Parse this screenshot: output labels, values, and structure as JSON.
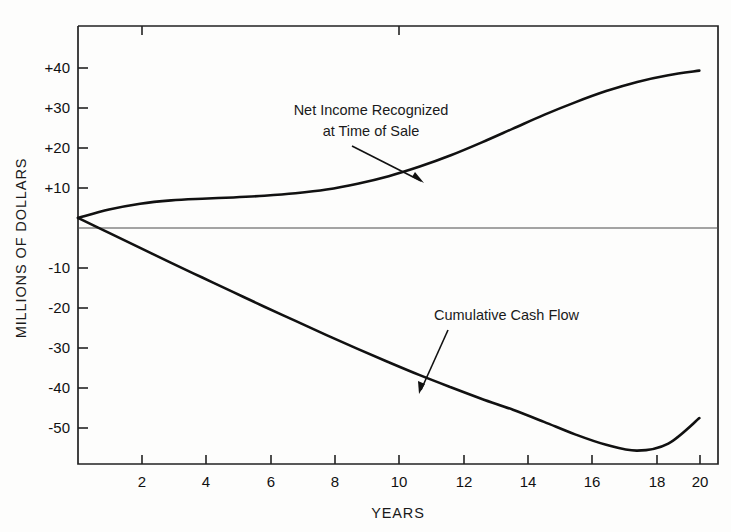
{
  "chart_data": {
    "type": "line",
    "title": "",
    "subtitle": "",
    "xlabel": "YEARS",
    "ylabel": "MILLIONS OF DOLLARS",
    "xlim": [
      0,
      20.6
    ],
    "ylim": [
      -59,
      46
    ],
    "grid": false,
    "legend_position": "inline-annotations",
    "x_ticks": [
      "2",
      "4",
      "6",
      "8",
      "10",
      "12",
      "14",
      "16",
      "18",
      "20"
    ],
    "x_tick_values": [
      2,
      4,
      6,
      8,
      10,
      12,
      14,
      16,
      18,
      20
    ],
    "y_ticks": [
      "+40",
      "+30",
      "+20",
      "+10",
      "-10",
      "-20",
      "-30",
      "-40",
      "-50"
    ],
    "y_tick_values": [
      40,
      30,
      20,
      10,
      -10,
      -20,
      -30,
      -40,
      -50
    ],
    "zero_line": 0,
    "x": [
      0,
      1,
      2,
      3,
      4,
      5,
      6,
      7,
      8,
      9,
      10,
      11,
      12,
      13,
      14,
      15,
      16,
      17,
      18,
      19,
      20
    ],
    "series": [
      {
        "name": "Net Income Recognized at Time of Sale",
        "values": [
          0,
          2.0,
          3.4,
          4.2,
          4.6,
          4.9,
          5.3,
          5.9,
          6.8,
          8.2,
          10.0,
          12.3,
          15.0,
          18.1,
          21.4,
          24.7,
          27.7,
          30.4,
          32.6,
          34.2,
          35.3
        ]
      },
      {
        "name": "Cumulative Cash Flow",
        "values": [
          0,
          -3.6,
          -7.2,
          -10.8,
          -14.3,
          -17.8,
          -21.3,
          -24.7,
          -28.1,
          -31.4,
          -34.6,
          -37.7,
          -40.6,
          -43.4,
          -46.0,
          -48.9,
          -51.9,
          -54.4,
          -55.8,
          -54.1,
          -48.0
        ]
      }
    ],
    "annotations": [
      {
        "id": "net-income-annotation",
        "line1": "Net Income Recognized",
        "line2": "at Time of Sale",
        "arrow_points_to_x": 11.0,
        "arrow_points_to_y": 11.5
      },
      {
        "id": "cumulative-cash-flow-annotation",
        "line1": "Cumulative Cash Flow",
        "line2": "",
        "arrow_points_to_x": 10.6,
        "arrow_points_to_y": -41.8
      }
    ],
    "colors": {
      "curve": "#111111",
      "axis": "#222222",
      "zero_line": "#444444",
      "background": "#fdfdfc"
    }
  }
}
